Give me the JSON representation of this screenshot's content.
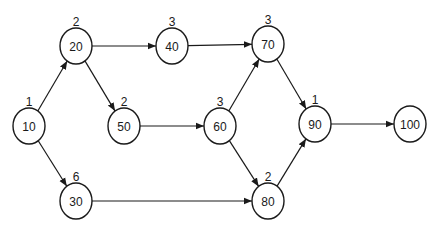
{
  "diagram": {
    "type": "network-activity-diagram",
    "nodes": [
      {
        "id": "10",
        "label": "10",
        "duration": "1"
      },
      {
        "id": "20",
        "label": "20",
        "duration": "2"
      },
      {
        "id": "30",
        "label": "30",
        "duration": "6"
      },
      {
        "id": "40",
        "label": "40",
        "duration": "3"
      },
      {
        "id": "50",
        "label": "50",
        "duration": "2"
      },
      {
        "id": "60",
        "label": "60",
        "duration": "3"
      },
      {
        "id": "70",
        "label": "70",
        "duration": "3"
      },
      {
        "id": "80",
        "label": "80",
        "duration": "2"
      },
      {
        "id": "90",
        "label": "90",
        "duration": "1"
      },
      {
        "id": "100",
        "label": "100",
        "duration": ""
      }
    ],
    "edges": [
      {
        "from": "10",
        "to": "20"
      },
      {
        "from": "10",
        "to": "30"
      },
      {
        "from": "20",
        "to": "40"
      },
      {
        "from": "20",
        "to": "50"
      },
      {
        "from": "40",
        "to": "70"
      },
      {
        "from": "50",
        "to": "60"
      },
      {
        "from": "60",
        "to": "70"
      },
      {
        "from": "60",
        "to": "80"
      },
      {
        "from": "30",
        "to": "80"
      },
      {
        "from": "70",
        "to": "90"
      },
      {
        "from": "80",
        "to": "90"
      },
      {
        "from": "90",
        "to": "100"
      }
    ],
    "colors": {
      "stroke": "#1a1a1a",
      "background": "#ffffff"
    }
  }
}
